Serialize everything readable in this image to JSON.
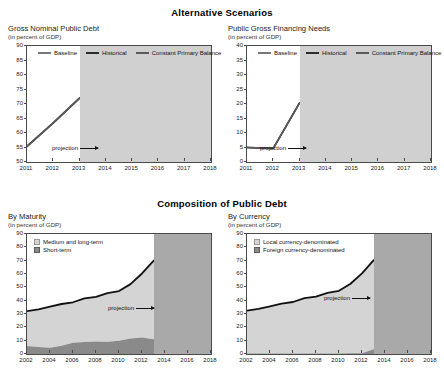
{
  "titles": {
    "alternative_scenarios": "Alternative Scenarios",
    "composition": "Composition of Public Debt"
  },
  "labels": {
    "unit": "(in percent of GDP)",
    "projection": "projection"
  },
  "chart_data": [
    {
      "id": "gross-nominal-public-debt",
      "type": "line",
      "title": "Gross Nominal Public Debt",
      "subtitle": "(in percent of GDP)",
      "xlabel": "",
      "ylabel": "",
      "ylim": [
        50,
        90
      ],
      "yticks": [
        50,
        55,
        60,
        65,
        70,
        75,
        80,
        85,
        90
      ],
      "x": [
        2011,
        2012,
        2013,
        2014,
        2015,
        2016,
        2017,
        2018
      ],
      "xticklabels": [
        "2011",
        "2012",
        "2013",
        "2014",
        "2015",
        "2016",
        "2017",
        "2018"
      ],
      "grid": false,
      "legend_position": "top-inside",
      "projection_start": 2013,
      "annotation": "projection",
      "series": [
        {
          "name": "Baseline",
          "color": "#8c8c8c",
          "values": [
            55.4,
            63.5,
            72.0,
            75.6,
            76.3,
            76.3,
            76.1,
            75.9
          ]
        },
        {
          "name": "Historical",
          "color": "#2b2b2b",
          "values": [
            55.4,
            63.5,
            72.0,
            75.3,
            76.6,
            79.0,
            81.5,
            84.1
          ]
        },
        {
          "name": "Constant Primary Balance",
          "color": "#5a5a5a",
          "values": [
            55.4,
            63.5,
            72.0,
            76.2,
            76.6,
            76.4,
            76.2,
            76.0
          ]
        }
      ]
    },
    {
      "id": "public-gross-financing-needs",
      "type": "line",
      "title": "Public Gross Financing Needs",
      "subtitle": "(in percent of GDP)",
      "xlabel": "",
      "ylabel": "",
      "ylim": [
        0,
        40
      ],
      "yticks": [
        0,
        5,
        10,
        15,
        20,
        25,
        30,
        35,
        40
      ],
      "x": [
        2011,
        2012,
        2013,
        2014,
        2015,
        2016,
        2017,
        2018
      ],
      "xticklabels": [
        "2011",
        "2012",
        "2013",
        "2014",
        "2015",
        "2016",
        "2017",
        "2018"
      ],
      "grid": false,
      "legend_position": "top-inside",
      "projection_start": 2013,
      "annotation": "projection",
      "series": [
        {
          "name": "Baseline",
          "color": "#8c8c8c",
          "values": [
            5.0,
            4.7,
            20.4,
            19.8,
            20.0,
            25.5,
            31.5,
            19.2
          ]
        },
        {
          "name": "Historical",
          "color": "#2b2b2b",
          "values": [
            5.0,
            4.7,
            20.4,
            20.3,
            21.8,
            28.0,
            35.8,
            22.8
          ]
        },
        {
          "name": "Constant Primary Balance",
          "color": "#5a5a5a",
          "values": [
            5.0,
            4.7,
            20.4,
            20.0,
            20.6,
            26.2,
            32.0,
            19.6
          ]
        }
      ]
    },
    {
      "id": "composition-by-maturity",
      "type": "area",
      "title": "By Maturity",
      "subtitle": "(in percent of GDP)",
      "xlabel": "",
      "ylabel": "",
      "ylim": [
        0,
        90
      ],
      "yticks": [
        0,
        10,
        20,
        30,
        40,
        50,
        60,
        70,
        80,
        90
      ],
      "x": [
        2002,
        2003,
        2004,
        2005,
        2006,
        2007,
        2008,
        2009,
        2010,
        2011,
        2012,
        2013,
        2014,
        2015,
        2016,
        2017,
        2018
      ],
      "xticklabels": [
        "2002",
        "2004",
        "2006",
        "2008",
        "2010",
        "2012",
        "2014",
        "2016",
        "2018"
      ],
      "grid": false,
      "stacked": true,
      "legend_position": "top-left-inside",
      "projection_start": 2013,
      "annotation": "projection",
      "series": [
        {
          "name": "Short-term",
          "color": "#8a8a8a",
          "values": [
            6.0,
            5.2,
            4.6,
            6.2,
            8.4,
            9.0,
            9.4,
            9.2,
            10.0,
            11.6,
            12.3,
            11.0,
            8.8,
            8.6,
            15.3,
            9.2,
            9.0
          ]
        },
        {
          "name": "Medium and long-term",
          "color": "#d4d4d4",
          "values": [
            26.2,
            28.3,
            30.9,
            31.3,
            30.4,
            32.7,
            33.4,
            36.4,
            37.2,
            40.8,
            48.1,
            58.8,
            68.2,
            68.4,
            61.5,
            67.0,
            66.5
          ]
        }
      ],
      "total": [
        32.2,
        33.5,
        35.5,
        37.5,
        38.8,
        41.7,
        42.8,
        45.6,
        47.2,
        52.4,
        60.4,
        69.8,
        77.0,
        77.0,
        76.8,
        76.2,
        75.5
      ]
    },
    {
      "id": "composition-by-currency",
      "type": "area",
      "title": "By Currency",
      "subtitle": "(in percent of GDP)",
      "xlabel": "",
      "ylabel": "",
      "ylim": [
        0,
        90
      ],
      "yticks": [
        0,
        10,
        20,
        30,
        40,
        50,
        60,
        70,
        80,
        90
      ],
      "x": [
        2002,
        2003,
        2004,
        2005,
        2006,
        2007,
        2008,
        2009,
        2010,
        2011,
        2012,
        2013,
        2014,
        2015,
        2016,
        2017,
        2018
      ],
      "xticklabels": [
        "2002",
        "2004",
        "2006",
        "2008",
        "2010",
        "2012",
        "2014",
        "2016",
        "2018"
      ],
      "grid": false,
      "stacked": true,
      "legend_position": "top-left-inside",
      "projection_start": 2013,
      "annotation": "projection",
      "series": [
        {
          "name": "Foreign currency-denominated",
          "color": "#8a8a8a",
          "values": [
            0.4,
            0.4,
            0.4,
            0.4,
            0.4,
            0.4,
            0.4,
            0.4,
            0.4,
            0.5,
            0.6,
            3.6,
            4.2,
            4.4,
            4.8,
            5.6,
            9.8
          ]
        },
        {
          "name": "Local currency-denominated",
          "color": "#d4d4d4",
          "values": [
            32.1,
            33.4,
            35.3,
            37.3,
            38.6,
            41.5,
            42.6,
            45.4,
            47.0,
            52.2,
            59.9,
            66.6,
            73.2,
            73.0,
            72.4,
            71.0,
            66.4
          ]
        }
      ],
      "total": [
        32.5,
        33.8,
        35.7,
        37.7,
        39.0,
        41.9,
        43.0,
        45.8,
        47.4,
        52.7,
        60.5,
        70.2,
        77.4,
        77.4,
        77.2,
        76.6,
        76.2
      ]
    }
  ],
  "legends": {
    "scenarios": [
      "Baseline",
      "Historical",
      "Constant Primary Balance"
    ],
    "maturity": [
      "Medium and long-term",
      "Short-term"
    ],
    "currency": [
      "Local currency-denominated",
      "Foreign currency-denominated"
    ]
  },
  "colors": {
    "baseline": "#8c8c8c",
    "historical": "#2b2b2b",
    "constant_primary_balance": "#5a5a5a",
    "area_light": "#d4d4d4",
    "area_dark": "#8a8a8a",
    "projection_shade": "#d0d0d0",
    "projection_shade_dark": "#a9a9a9",
    "axis": "#4a4a4a"
  }
}
